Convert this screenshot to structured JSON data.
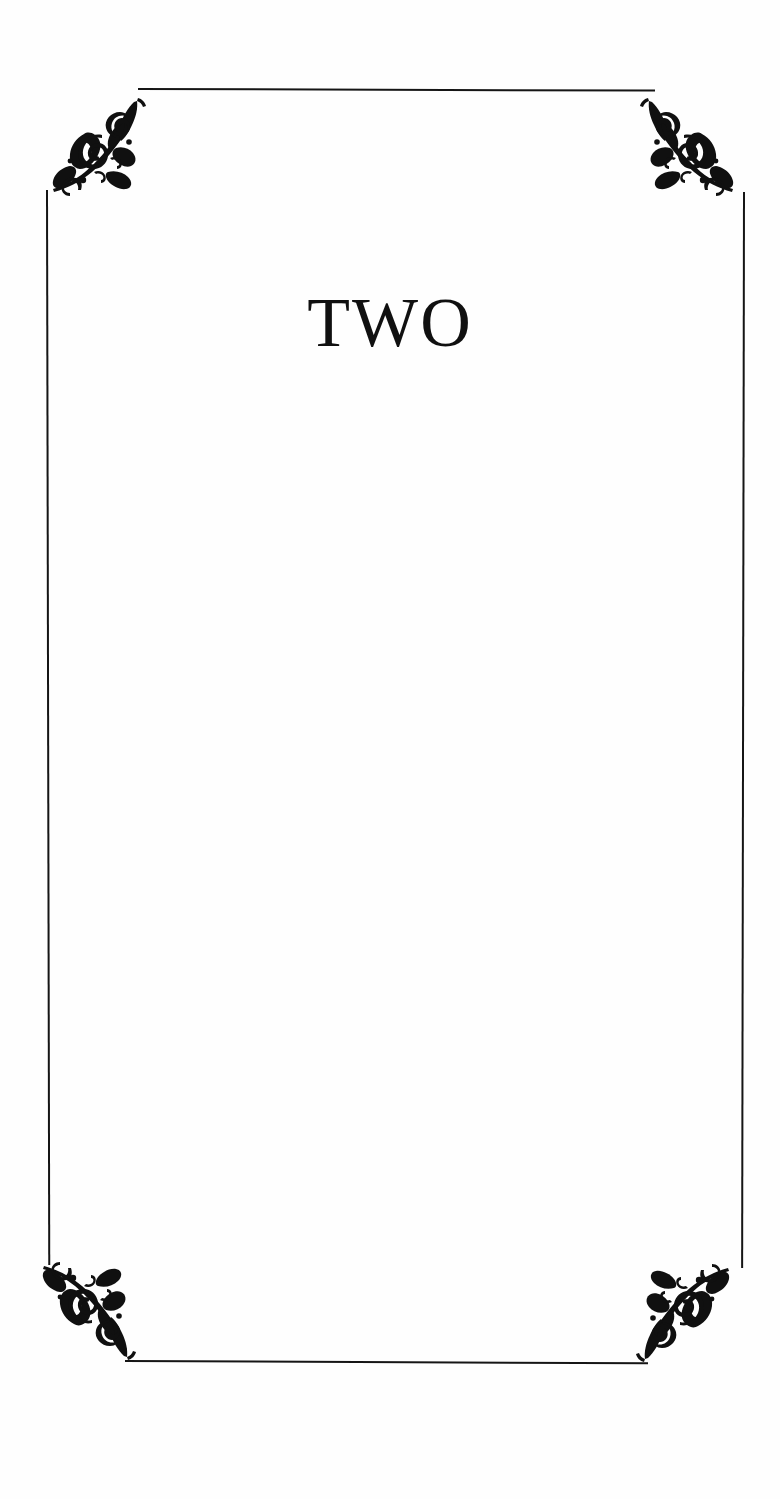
{
  "page": {
    "kind": "book-chapter-opening-page",
    "background_color": "#fefefe",
    "ink_color": "#151515",
    "width": 780,
    "height": 1499
  },
  "chapter": {
    "title": "TWO",
    "title_color": "#101010"
  },
  "frame": {
    "style": "hairline-rectangle",
    "color": "#151515",
    "rules": [
      {
        "name": "top-rule"
      },
      {
        "name": "right-rule"
      },
      {
        "name": "bottom-rule"
      },
      {
        "name": "left-rule"
      }
    ]
  },
  "ornaments": {
    "style": "victorian-floral-filigree",
    "color": "#101010",
    "corners": [
      {
        "name": "top-left-ornament"
      },
      {
        "name": "top-right-ornament"
      },
      {
        "name": "bottom-left-ornament"
      },
      {
        "name": "bottom-right-ornament"
      }
    ]
  },
  "body": {
    "text": ""
  }
}
